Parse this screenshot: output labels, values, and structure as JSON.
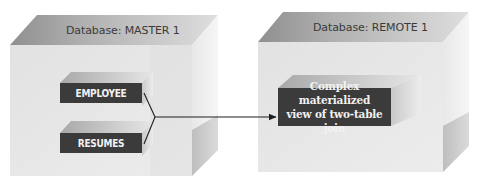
{
  "diagram": {
    "type": "replication-architecture",
    "databases": [
      {
        "id": "master1",
        "label": "Database: MASTER 1",
        "tables": [
          {
            "id": "employee",
            "label": "EMPLOYEE"
          },
          {
            "id": "resumes",
            "label": "RESUMES"
          }
        ]
      },
      {
        "id": "remote1",
        "label": "Database: REMOTE 1",
        "objects": [
          {
            "id": "complex_view",
            "label_line1": "Complex materialized",
            "label_line2": "view of two-table join"
          }
        ]
      }
    ],
    "connections": [
      {
        "from": [
          "employee",
          "resumes"
        ],
        "to": "complex_view",
        "style": "arrow-merge"
      }
    ],
    "colors": {
      "box_front": "#e6e6e6",
      "box_top": "#b5b5b5",
      "box_side": "#cfcfcf",
      "table_front": "#3d3d3d",
      "table_top": "#cdcdcd",
      "table_side": "#c2c2c2",
      "connector": "#222222"
    }
  }
}
